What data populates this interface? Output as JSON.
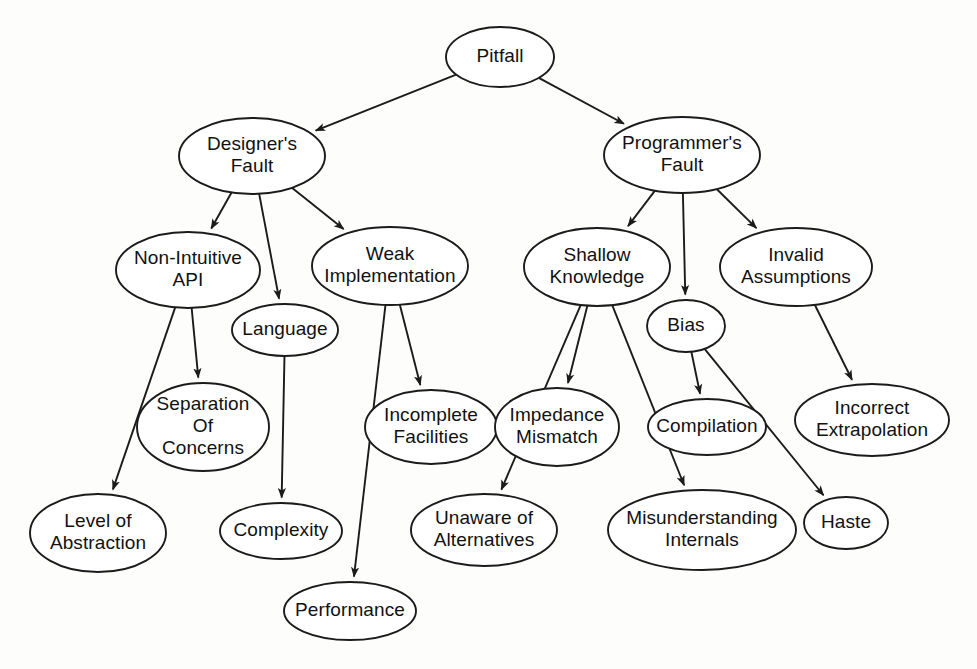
{
  "diagram": {
    "title": "Pitfall",
    "type": "tree-graph",
    "background_color": "#fdfdfc",
    "node_fill": "#ffffff",
    "node_stroke": "#1b1b1b",
    "edge_color": "#1b1b1b",
    "text_color": "#111111",
    "nodes": [
      {
        "id": "pitfall",
        "lines": [
          "Pitfall"
        ],
        "cx": 500,
        "cy": 57,
        "rx": 54,
        "ry": 30
      },
      {
        "id": "designers",
        "lines": [
          "Designer's",
          "Fault"
        ],
        "cx": 252,
        "cy": 156,
        "rx": 73,
        "ry": 38
      },
      {
        "id": "programmers",
        "lines": [
          "Programmer's",
          "Fault"
        ],
        "cx": 682,
        "cy": 155,
        "rx": 78,
        "ry": 38
      },
      {
        "id": "nonintuitive",
        "lines": [
          "Non-Intuitive",
          "API"
        ],
        "cx": 188,
        "cy": 270,
        "rx": 72,
        "ry": 38
      },
      {
        "id": "weakimpl",
        "lines": [
          "Weak",
          "Implementation"
        ],
        "cx": 390,
        "cy": 266,
        "rx": 78,
        "ry": 39
      },
      {
        "id": "language",
        "lines": [
          "Language"
        ],
        "cx": 285,
        "cy": 330,
        "rx": 53,
        "ry": 26
      },
      {
        "id": "shallow",
        "lines": [
          "Shallow",
          "Knowledge"
        ],
        "cx": 597,
        "cy": 267,
        "rx": 73,
        "ry": 39
      },
      {
        "id": "invalid",
        "lines": [
          "Invalid",
          "Assumptions"
        ],
        "cx": 796,
        "cy": 267,
        "rx": 76,
        "ry": 39
      },
      {
        "id": "bias",
        "lines": [
          "Bias"
        ],
        "cx": 686,
        "cy": 326,
        "rx": 39,
        "ry": 26
      },
      {
        "id": "separation",
        "lines": [
          "Separation",
          "Of",
          "Concerns"
        ],
        "cx": 203,
        "cy": 427,
        "rx": 66,
        "ry": 44
      },
      {
        "id": "incomplete",
        "lines": [
          "Incomplete",
          "Facilities"
        ],
        "cx": 431,
        "cy": 427,
        "rx": 66,
        "ry": 37
      },
      {
        "id": "impedance",
        "lines": [
          "Impedance",
          "Mismatch"
        ],
        "cx": 557,
        "cy": 427,
        "rx": 62,
        "ry": 39
      },
      {
        "id": "compilation",
        "lines": [
          "Compilation"
        ],
        "cx": 707,
        "cy": 427,
        "rx": 59,
        "ry": 28
      },
      {
        "id": "incorrect",
        "lines": [
          "Incorrect",
          "Extrapolation"
        ],
        "cx": 872,
        "cy": 420,
        "rx": 77,
        "ry": 36
      },
      {
        "id": "levelabs",
        "lines": [
          "Level of",
          "Abstraction"
        ],
        "cx": 98,
        "cy": 533,
        "rx": 68,
        "ry": 39
      },
      {
        "id": "complexity",
        "lines": [
          "Complexity"
        ],
        "cx": 281,
        "cy": 531,
        "rx": 61,
        "ry": 28
      },
      {
        "id": "unaware",
        "lines": [
          "Unaware of",
          "Alternatives"
        ],
        "cx": 484,
        "cy": 530,
        "rx": 73,
        "ry": 36
      },
      {
        "id": "misunderstand",
        "lines": [
          "Misunderstanding",
          "Internals"
        ],
        "cx": 702,
        "cy": 530,
        "rx": 94,
        "ry": 40
      },
      {
        "id": "haste",
        "lines": [
          "Haste"
        ],
        "cx": 846,
        "cy": 523,
        "rx": 42,
        "ry": 26
      },
      {
        "id": "performance",
        "lines": [
          "Performance"
        ],
        "cx": 350,
        "cy": 611,
        "rx": 66,
        "ry": 29
      }
    ],
    "edges": [
      {
        "from": "pitfall",
        "to": "designers",
        "label": ""
      },
      {
        "from": "pitfall",
        "to": "programmers",
        "label": ""
      },
      {
        "from": "designers",
        "to": "nonintuitive",
        "label": ""
      },
      {
        "from": "designers",
        "to": "language",
        "label": ""
      },
      {
        "from": "designers",
        "to": "weakimpl",
        "label": ""
      },
      {
        "from": "programmers",
        "to": "shallow",
        "label": ""
      },
      {
        "from": "programmers",
        "to": "bias",
        "label": ""
      },
      {
        "from": "programmers",
        "to": "invalid",
        "label": ""
      },
      {
        "from": "nonintuitive",
        "to": "levelabs",
        "label": ""
      },
      {
        "from": "nonintuitive",
        "to": "separation",
        "label": ""
      },
      {
        "from": "language",
        "to": "complexity",
        "label": ""
      },
      {
        "from": "weakimpl",
        "to": "incomplete",
        "label": ""
      },
      {
        "from": "weakimpl",
        "to": "performance",
        "label": ""
      },
      {
        "from": "shallow",
        "to": "impedance",
        "label": ""
      },
      {
        "from": "shallow",
        "to": "unaware",
        "label": ""
      },
      {
        "from": "shallow",
        "to": "misunderstand",
        "label": ""
      },
      {
        "from": "bias",
        "to": "compilation",
        "label": ""
      },
      {
        "from": "bias",
        "to": "haste",
        "label": ""
      },
      {
        "from": "invalid",
        "to": "incorrect",
        "label": ""
      }
    ]
  }
}
